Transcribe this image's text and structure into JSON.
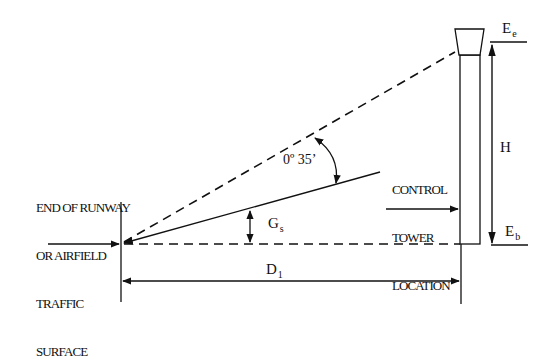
{
  "diagram": {
    "labels": {
      "runway_end": [
        "END OF RUNWAY",
        "OR AIRFIELD",
        "TRAFFIC",
        "SURFACE"
      ],
      "tower_location": [
        "CONTROL",
        "TOWER",
        "LOCATION"
      ],
      "angle": "0º 35’",
      "gs_main": "G",
      "gs_sub": "s",
      "h": "H",
      "ee_main": "E",
      "ee_sub": "e",
      "eb_main": "E",
      "eb_sub": "b",
      "d_main": "D",
      "d_sub": "1"
    },
    "colors": {
      "line": "#111111",
      "background": "#ffffff"
    }
  }
}
